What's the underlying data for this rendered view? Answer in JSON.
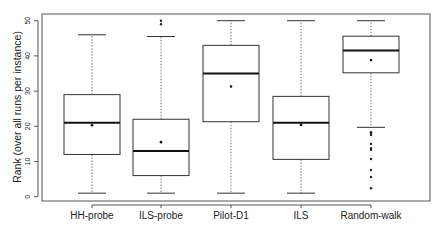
{
  "chart_data": {
    "type": "boxplot",
    "title": "",
    "xlabel": "",
    "ylabel": "Rank (over all runs per instance)",
    "ylim": [
      0,
      50
    ],
    "yticks": [
      0,
      10,
      20,
      30,
      40,
      50
    ],
    "grid": false,
    "legend": null,
    "categories": [
      "HH-probe",
      "ILS-probe",
      "Pilot-D1",
      "ILS",
      "Random-walk"
    ],
    "series": [
      {
        "name": "HH-probe",
        "whisker_low": 1,
        "q1": 12,
        "median": 21,
        "q3": 29,
        "whisker_high": 46,
        "mean": 20.3,
        "outliers": []
      },
      {
        "name": "ILS-probe",
        "whisker_low": 1,
        "q1": 6,
        "median": 13,
        "q3": 22,
        "whisker_high": 45.5,
        "mean": 15.5,
        "outliers": [
          49,
          50
        ]
      },
      {
        "name": "Pilot-D1",
        "whisker_low": 1,
        "q1": 21.3,
        "median": 35,
        "q3": 43,
        "whisker_high": 50,
        "mean": 31.3,
        "outliers": []
      },
      {
        "name": "ILS",
        "whisker_low": 1,
        "q1": 10.6,
        "median": 21,
        "q3": 28.5,
        "whisker_high": 50,
        "mean": 20.4,
        "outliers": []
      },
      {
        "name": "Random-walk",
        "whisker_low": 19.7,
        "q1": 35.2,
        "median": 41.5,
        "q3": 45.6,
        "whisker_high": 50,
        "mean": 38.8,
        "outliers": [
          18.3,
          17.9,
          17.5,
          15,
          13.8,
          13.3,
          10.7,
          7.6,
          5.6,
          2.4
        ]
      }
    ]
  }
}
